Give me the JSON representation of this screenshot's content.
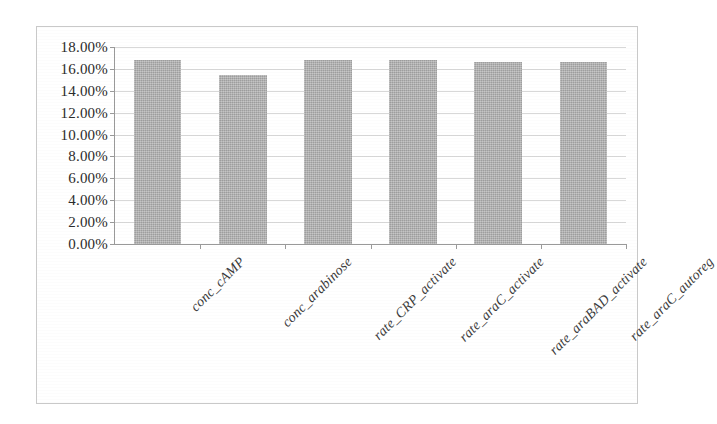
{
  "chart_data": {
    "type": "bar",
    "title": "",
    "subtitle": "",
    "xlabel": "",
    "ylabel": "",
    "categories": [
      "conc_cAMP",
      "conc_arabinose",
      "rate_CRP_activate",
      "rate_araC_activate",
      "rate_araBAD_activate",
      "rate_araC_autoreg"
    ],
    "values": [
      16.8,
      15.4,
      16.8,
      16.8,
      16.6,
      16.6
    ],
    "value_labels": [
      "16.80%",
      "15.40%",
      "16.80%",
      "16.80%",
      "16.60%",
      "16.60%"
    ],
    "ylim": [
      0,
      18
    ],
    "ytick_values": [
      0,
      2,
      4,
      6,
      8,
      10,
      12,
      14,
      16,
      18
    ],
    "ytick_labels": [
      "0.00%",
      "2.00%",
      "4.00%",
      "6.00%",
      "8.00%",
      "10.00%",
      "12.00%",
      "14.00%",
      "16.00%",
      "18.00%"
    ],
    "grid": true,
    "legend": false,
    "legend_position": "none",
    "series": [
      {
        "name": "sensitivity",
        "values": [
          16.8,
          15.4,
          16.8,
          16.8,
          16.6,
          16.6
        ]
      }
    ],
    "colors": {
      "bar_fill": "#b0b0b0",
      "gridline": "#d8d8d8",
      "axis": "#9a9a9a",
      "frame": "#c9c9c9",
      "tick_label": "#2b2b2b",
      "category_label": "#3a3a3a",
      "background": "#ffffff"
    }
  }
}
